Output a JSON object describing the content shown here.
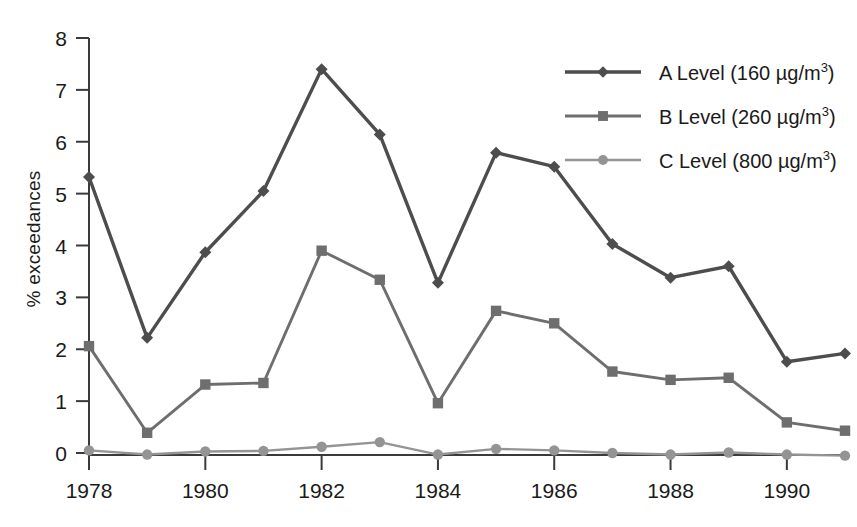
{
  "chart_data": {
    "type": "line",
    "title": "",
    "xlabel": "",
    "ylabel": "% exceedances",
    "xlim": [
      1978,
      1991
    ],
    "ylim": [
      0,
      8
    ],
    "grid": false,
    "legend_position": "top-right",
    "x": [
      1978,
      1979,
      1980,
      1981,
      1982,
      1983,
      1984,
      1985,
      1986,
      1987,
      1988,
      1989,
      1990,
      1991
    ],
    "xticks": [
      1978,
      1980,
      1982,
      1984,
      1986,
      1988,
      1990
    ],
    "xtick_labels": [
      "1978",
      "1980",
      "1982",
      "1984",
      "1986",
      "1988",
      "1990"
    ],
    "yticks": [
      0,
      1,
      2,
      3,
      4,
      5,
      6,
      7,
      8
    ],
    "ytick_labels": [
      "0",
      "1",
      "2",
      "3",
      "4",
      "5",
      "6",
      "7",
      "8"
    ],
    "series": [
      {
        "name": "A Level (160 µg/m3)",
        "label_base": "A Level (160 µg/m",
        "label_sup": "3",
        "label_tail": ")",
        "marker": "diamond",
        "color": "#4d4d4d",
        "values": [
          5.32,
          2.22,
          3.87,
          5.05,
          7.4,
          6.14,
          3.28,
          5.79,
          5.52,
          4.03,
          3.38,
          3.6,
          1.76,
          1.92
        ]
      },
      {
        "name": "B Level (260 µg/m3)",
        "label_base": "B Level (260 µg/m",
        "label_sup": "3",
        "label_tail": ")",
        "marker": "square",
        "color": "#6e6e6e",
        "values": [
          2.06,
          0.39,
          1.32,
          1.35,
          3.9,
          3.34,
          0.96,
          2.74,
          2.5,
          1.57,
          1.41,
          1.45,
          0.59,
          0.43
        ]
      },
      {
        "name": "C Level (800 µg/m3)",
        "label_base": "C Level (800 µg/m",
        "label_sup": "3",
        "label_tail": ")",
        "marker": "circle",
        "color": "#949494",
        "values": [
          0.05,
          -0.03,
          0.03,
          0.04,
          0.12,
          0.21,
          -0.03,
          0.08,
          0.05,
          0.0,
          -0.03,
          0.01,
          -0.03,
          -0.05
        ]
      }
    ]
  },
  "axis": {
    "ylabel_text": "% exceedances"
  }
}
